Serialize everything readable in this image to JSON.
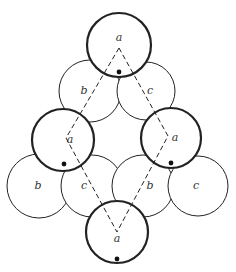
{
  "diagram": {
    "colors": {
      "stroke": "#222222",
      "background": "#ffffff"
    },
    "thick_circles": [
      {
        "id": "top",
        "cx": 119,
        "cy": 45,
        "r": 32,
        "label": "a",
        "lx": 119,
        "ly": 41,
        "dot": [
          119,
          72
        ]
      },
      {
        "id": "mid-left",
        "cx": 63,
        "cy": 140,
        "r": 31,
        "label": "a",
        "lx": 70,
        "ly": 143,
        "dot": [
          64,
          164
        ]
      },
      {
        "id": "mid-right",
        "cx": 171,
        "cy": 138,
        "r": 30,
        "label": "a",
        "lx": 175,
        "ly": 141,
        "dot": [
          171,
          163
        ]
      },
      {
        "id": "bottom",
        "cx": 117,
        "cy": 232,
        "r": 31,
        "label": "a",
        "lx": 117,
        "ly": 242,
        "dot": [
          117,
          259
        ]
      }
    ],
    "thin_circles": [
      {
        "id": "upper-b",
        "cx": 90,
        "cy": 91,
        "r": 31,
        "label": "b",
        "lx": 84,
        "ly": 94
      },
      {
        "id": "upper-c",
        "cx": 146,
        "cy": 91,
        "r": 29,
        "label": "c",
        "lx": 150,
        "ly": 94
      },
      {
        "id": "outer-b",
        "cx": 39,
        "cy": 186,
        "r": 32,
        "label": "b",
        "lx": 38,
        "ly": 189
      },
      {
        "id": "inner-c",
        "cx": 92,
        "cy": 186,
        "r": 31,
        "label": "c",
        "lx": 84,
        "ly": 189
      },
      {
        "id": "inner-b",
        "cx": 143,
        "cy": 186,
        "r": 31,
        "label": "b",
        "lx": 150,
        "ly": 189
      },
      {
        "id": "outer-c",
        "cx": 198,
        "cy": 186,
        "r": 30,
        "label": "c",
        "lx": 196,
        "ly": 189
      }
    ],
    "dashed_path": [
      [
        119,
        48
      ],
      [
        66,
        138
      ],
      [
        117,
        232
      ],
      [
        168,
        136
      ],
      [
        119,
        48
      ]
    ]
  }
}
